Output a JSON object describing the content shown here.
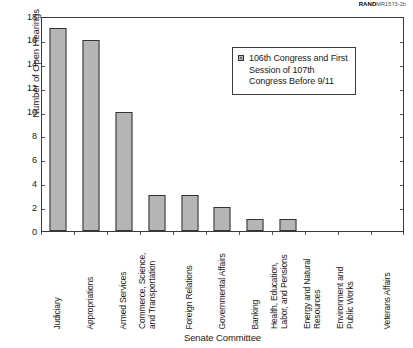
{
  "watermark": {
    "brand": "RAND",
    "code": "MR1573-2b"
  },
  "chart_data": {
    "type": "bar",
    "title": "",
    "xlabel": "Senate Committee",
    "ylabel": "Number of Open Hearings",
    "ylim": [
      0,
      18
    ],
    "yticks": [
      0,
      2,
      4,
      6,
      8,
      10,
      12,
      14,
      16,
      18
    ],
    "grid": false,
    "legend_position": "upper-right-inside",
    "categories": [
      "Judiciary",
      "Appropriations",
      "Armed Services",
      "Commerce, Science, and Transportation",
      "Foreign Relations",
      "Governmental Affairs",
      "Banking",
      "Health, Education, Labor, and Pensions",
      "Energy and Natural Resources",
      "Environment and Public Works",
      "Veterans Affairs"
    ],
    "category_lines": [
      [
        "Judiciary"
      ],
      [
        "Appropriations"
      ],
      [
        "Armed Services"
      ],
      [
        "Commerce, Science,",
        "and Transportation"
      ],
      [
        "Foreign Relations"
      ],
      [
        "Governmental Affairs"
      ],
      [
        "Banking"
      ],
      [
        "Health, Education,",
        "Labor, and Pensions"
      ],
      [
        "Energy and Natural",
        "Resources"
      ],
      [
        "Environment and",
        "Public Works"
      ],
      [
        "Veterans Affairs"
      ]
    ],
    "values": [
      17,
      16,
      10,
      3,
      3,
      2,
      1,
      1,
      0,
      0,
      0
    ],
    "series": [
      {
        "name": "106th Congress and First Session of 107th Congress Before 9/11",
        "values": [
          17,
          16,
          10,
          3,
          3,
          2,
          1,
          1,
          0,
          0,
          0
        ]
      }
    ],
    "legend": [
      "106th Congress and First\nSession of 107th\nCongress Before 9/11"
    ],
    "bar_color": "#b5b5b5",
    "bar_edge_color": "#333333"
  }
}
